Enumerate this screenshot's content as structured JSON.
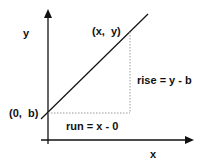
{
  "diagram": {
    "axes": {
      "x_label": "x",
      "y_label": "y"
    },
    "points": {
      "intercept": "(0,  b)",
      "point": "(x,  y)"
    },
    "annotations": {
      "rise": "rise = y - b",
      "run": "run = x - 0"
    },
    "colors": {
      "line": "#111111",
      "dotted": "#999999",
      "background": "#ffffff"
    }
  }
}
